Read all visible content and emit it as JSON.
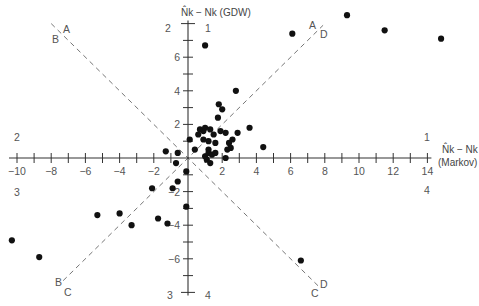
{
  "chart_data": {
    "type": "scatter",
    "title": "",
    "xlabel": "N̂k − Nk (Markov)",
    "xlabel_line1": "N̂k − Nk",
    "xlabel_line2": "(Markov)",
    "ylabel": "N̂k − Nk (GDW)",
    "xlim": [
      -10,
      14
    ],
    "ylim": [
      -8,
      8
    ],
    "x_ticks": [
      -10,
      -9,
      -8,
      -7,
      -6,
      -5,
      -4,
      -3,
      -2,
      -1,
      0,
      1,
      2,
      3,
      4,
      5,
      6,
      7,
      8,
      9,
      10,
      11,
      12,
      13,
      14
    ],
    "x_tick_labels": [
      {
        "value": -10,
        "label": "−10"
      },
      {
        "value": -8,
        "label": "−8"
      },
      {
        "value": -6,
        "label": "−6"
      },
      {
        "value": -4,
        "label": "−4"
      },
      {
        "value": -2,
        "label": "−2"
      },
      {
        "value": 2,
        "label": "2"
      },
      {
        "value": 4,
        "label": "4"
      },
      {
        "value": 6,
        "label": "6"
      },
      {
        "value": 8,
        "label": "8"
      },
      {
        "value": 10,
        "label": "10"
      },
      {
        "value": 12,
        "label": "12"
      },
      {
        "value": 14,
        "label": "14"
      }
    ],
    "y_ticks": [
      -8,
      -7,
      -6,
      -5,
      -4,
      -3,
      -2,
      -1,
      1,
      2,
      3,
      4,
      5,
      6,
      7,
      8
    ],
    "y_tick_labels": [
      {
        "value": 6,
        "label": "6"
      },
      {
        "value": 4,
        "label": "4"
      },
      {
        "value": 2,
        "label": "2"
      },
      {
        "value": -2,
        "label": "−2"
      },
      {
        "value": -4,
        "label": "−4"
      },
      {
        "value": -6,
        "label": "−6"
      }
    ],
    "grid": false,
    "legend": "none",
    "quadrant_labels": [
      {
        "label": "1",
        "where": "top-right-of-y-axis"
      },
      {
        "label": "2",
        "where": "top-left-of-y-axis"
      },
      {
        "label": "3",
        "where": "bottom-left-of-y-axis"
      },
      {
        "label": "4",
        "where": "bottom-right-of-y-axis"
      },
      {
        "label": "1",
        "where": "right-above-x-axis"
      },
      {
        "label": "2",
        "where": "left-above-x-axis"
      },
      {
        "label": "3",
        "where": "left-below-x-axis"
      },
      {
        "label": "4",
        "where": "right-below-x-axis"
      }
    ],
    "reference_lines": [
      {
        "name": "line-y-equals-x",
        "slope": 1,
        "end_labels": [
          [
            "B",
            "C"
          ],
          [
            "A",
            "D"
          ]
        ]
      },
      {
        "name": "line-y-equals-minus-x",
        "slope": -1,
        "end_labels": [
          [
            "B",
            "A"
          ],
          [
            "C",
            "D"
          ]
        ]
      }
    ],
    "points": [
      [
        1.0,
        6.7
      ],
      [
        6.1,
        7.4
      ],
      [
        9.3,
        8.5
      ],
      [
        11.5,
        7.6
      ],
      [
        14.8,
        7.1
      ],
      [
        2.8,
        4.0
      ],
      [
        1.8,
        3.2
      ],
      [
        2.0,
        2.9
      ],
      [
        1.75,
        2.4
      ],
      [
        3.6,
        1.8
      ],
      [
        4.4,
        0.65
      ],
      [
        2.9,
        1.5
      ],
      [
        2.6,
        1.1
      ],
      [
        2.2,
        1.5
      ],
      [
        0.1,
        1.1
      ],
      [
        -1.3,
        0.4
      ],
      [
        -0.6,
        0.3
      ],
      [
        0.6,
        1.4
      ],
      [
        0.7,
        1.7
      ],
      [
        0.9,
        1.6
      ],
      [
        1.0,
        1.8
      ],
      [
        1.3,
        1.7
      ],
      [
        0.9,
        1.1
      ],
      [
        1.2,
        1.0
      ],
      [
        1.5,
        1.4
      ],
      [
        1.6,
        0.9
      ],
      [
        1.9,
        1.6
      ],
      [
        2.4,
        0.9
      ],
      [
        2.5,
        0.6
      ],
      [
        2.3,
        0.5
      ],
      [
        0.4,
        0.5
      ],
      [
        1.2,
        0.5
      ],
      [
        1.0,
        0.1
      ],
      [
        1.2,
        0.3
      ],
      [
        1.4,
        0.2
      ],
      [
        1.6,
        0.3
      ],
      [
        1.1,
        -0.1
      ],
      [
        1.3,
        -0.3
      ],
      [
        2.2,
        0.0
      ],
      [
        -0.7,
        -0.3
      ],
      [
        -0.1,
        -0.8
      ],
      [
        -0.6,
        -1.4
      ],
      [
        -0.9,
        -1.8
      ],
      [
        -2.1,
        -1.8
      ],
      [
        -0.1,
        -2.9
      ],
      [
        -5.3,
        -3.4
      ],
      [
        -4.0,
        -3.3
      ],
      [
        -3.3,
        -4.0
      ],
      [
        -1.75,
        -3.6
      ],
      [
        -1.2,
        -3.9
      ],
      [
        -10.3,
        -4.9
      ],
      [
        -8.7,
        -5.9
      ],
      [
        6.6,
        -6.1
      ]
    ]
  }
}
